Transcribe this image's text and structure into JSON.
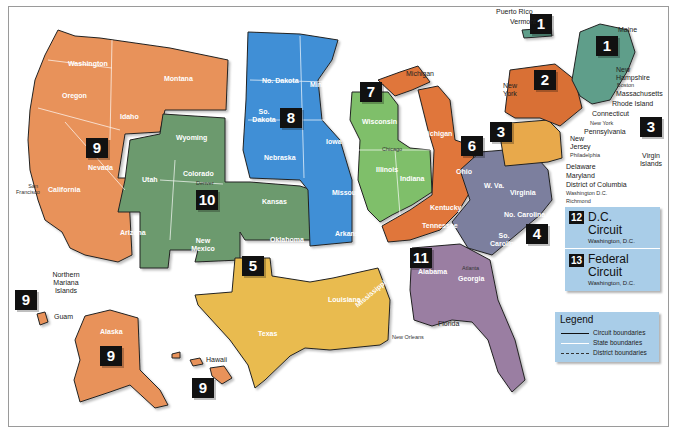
{
  "colors": {
    "circuit_1": "#5f9e8a",
    "circuit_2": "#d96f35",
    "circuit_3": "#e8a94c",
    "circuit_4": "#7b7f9e",
    "circuit_5": "#e9bb4f",
    "circuit_6": "#e0763a",
    "circuit_7": "#7fbf6a",
    "circuit_8": "#3f8fd6",
    "circuit_9": "#e8925a",
    "circuit_10": "#6c9a6e",
    "circuit_11": "#9a7ea2",
    "dc_box": "#a9cde8"
  },
  "circuits": [
    {
      "number": "1",
      "states": [
        "Maine",
        "New Hampshire",
        "Massachusetts",
        "Rhode Island",
        "Puerto Rico"
      ]
    },
    {
      "number": "2",
      "states": [
        "Vermont",
        "New York",
        "Connecticut"
      ]
    },
    {
      "number": "3",
      "states": [
        "Pennsylvania",
        "New Jersey",
        "Delaware",
        "Virgin Islands"
      ]
    },
    {
      "number": "4",
      "states": [
        "Maryland",
        "W. Va.",
        "Virginia",
        "No. Carolina",
        "So. Carolina"
      ]
    },
    {
      "number": "5",
      "states": [
        "Texas",
        "Louisiana",
        "Mississippi"
      ]
    },
    {
      "number": "6",
      "states": [
        "Michigan",
        "Ohio",
        "Kentucky",
        "Tennessee"
      ]
    },
    {
      "number": "7",
      "states": [
        "Wisconsin",
        "Illinois",
        "Indiana"
      ]
    },
    {
      "number": "8",
      "states": [
        "No. Dakota",
        "So. Dakota",
        "Nebraska",
        "Minnesota",
        "Iowa",
        "Missouri",
        "Arkansas"
      ]
    },
    {
      "number": "9",
      "states": [
        "Washington",
        "Oregon",
        "California",
        "Nevada",
        "Idaho",
        "Montana",
        "Arizona",
        "Alaska",
        "Hawaii",
        "Guam",
        "Northern Mariana Islands"
      ]
    },
    {
      "number": "10",
      "states": [
        "Wyoming",
        "Utah",
        "Colorado",
        "Kansas",
        "New Mexico",
        "Oklahoma"
      ]
    },
    {
      "number": "11",
      "states": [
        "Alabama",
        "Georgia",
        "Florida"
      ]
    }
  ],
  "labels": {
    "washington": "Washington",
    "oregon": "Oregon",
    "idaho": "Idaho",
    "montana": "Montana",
    "nevada": "Nevada",
    "california": "California",
    "arizona": "Arizona",
    "wyoming": "Wyoming",
    "utah": "Utah",
    "colorado": "Colorado",
    "kansas": "Kansas",
    "new_mexico": "New Mexico",
    "oklahoma": "Oklahoma",
    "no_dakota": "No. Dakota",
    "so_dakota": "So. Dakota",
    "nebraska": "Nebraska",
    "minnesota": "Minnesota",
    "iowa": "Iowa",
    "missouri": "Missouri",
    "arkansas": "Arkansas",
    "texas": "Texas",
    "louisiana": "Louisiana",
    "mississippi": "Mississippi",
    "wisconsin": "Wisconsin",
    "illinois": "Illinois",
    "indiana": "Indiana",
    "michigan_upper": "Michigan",
    "michigan": "Michigan",
    "ohio": "Ohio",
    "kentucky": "Kentucky",
    "tennessee": "Tennessee",
    "alabama": "Alabama",
    "georgia": "Georgia",
    "florida": "Florida",
    "w_va": "W. Va.",
    "virginia": "Virginia",
    "no_carolina": "No. Carolina",
    "so_carolina": "So. Carolina",
    "maine": "Maine",
    "new_hampshire": "New Hampshire",
    "massachusetts": "Massachusetts",
    "rhode_island": "Rhode Island",
    "connecticut": "Connecticut",
    "vermont": "Vermont",
    "new_york": "New York",
    "pennsylvania": "Pennsylvania",
    "new_jersey": "New Jersey",
    "delaware": "Delaware",
    "maryland": "Maryland",
    "district_of_columbia": "District of Columbia",
    "puerto_rico": "Puerto Rico",
    "virgin_islands": "Virgin Islands",
    "alaska": "Alaska",
    "hawaii": "Hawaii",
    "guam": "Guam",
    "northern_mariana": "Northern Mariana Islands"
  },
  "cities": {
    "san_francisco": "San Francisco",
    "denver": "Denver",
    "chicago": "Chicago",
    "st_louis": "St. Louis",
    "new_orleans": "New Orleans",
    "atlanta": "Atlanta",
    "cincinnati": "Cincinnati",
    "richmond": "Richmond",
    "washington_dc": "Washington D.C.",
    "philadelphia": "Philadelphia",
    "new_york_city": "New York",
    "boston": "Boston"
  },
  "special_circuits": [
    {
      "number": "12",
      "name": "D.C. Circuit",
      "name_line1": "D.C.",
      "name_line2": "Circuit",
      "location": "Washington, D.C."
    },
    {
      "number": "13",
      "name": "Federal Circuit",
      "name_line1": "Federal",
      "name_line2": "Circuit",
      "location": "Washington, D.C."
    }
  ],
  "legend": {
    "title": "Legend",
    "items": [
      {
        "label": "Circuit boundaries",
        "style": "solid-black"
      },
      {
        "label": "State boundaries",
        "style": "solid-white"
      },
      {
        "label": "District boundaries",
        "style": "dashed"
      }
    ]
  },
  "district_markers": [
    "N",
    "E",
    "C",
    "S",
    "W",
    "M"
  ]
}
